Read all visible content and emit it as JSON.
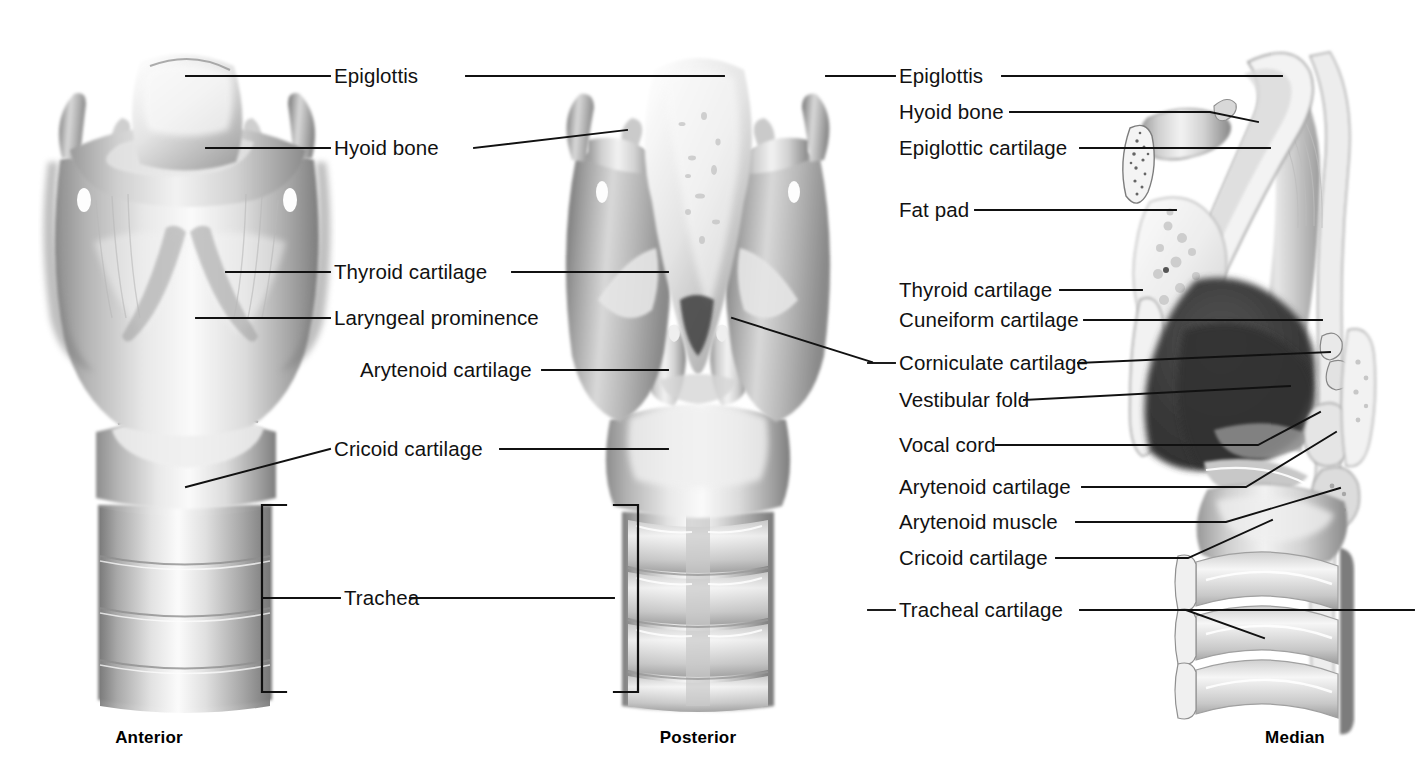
{
  "figure": {
    "kind": "anatomical-illustration",
    "background": "#ffffff",
    "line_color": "#111111",
    "views": [
      {
        "id": "anterior",
        "caption": "Anterior"
      },
      {
        "id": "posterior",
        "caption": "Posterior"
      },
      {
        "id": "median",
        "caption": "Median"
      }
    ]
  },
  "captions": {
    "anterior": "Anterior",
    "posterior": "Posterior",
    "median": "Median"
  },
  "labels_left": [
    {
      "id": "epiglottis",
      "text": "Epiglottis"
    },
    {
      "id": "hyoid-bone",
      "text": "Hyoid bone"
    },
    {
      "id": "thyroid-cartilage",
      "text": "Thyroid cartilage"
    },
    {
      "id": "laryngeal-prominence",
      "text": "Laryngeal prominence"
    },
    {
      "id": "arytenoid-cartilage",
      "text": "Arytenoid cartilage"
    },
    {
      "id": "cricoid-cartilage",
      "text": "Cricoid cartilage"
    },
    {
      "id": "trachea",
      "text": "Trachea"
    }
  ],
  "labels_right": [
    {
      "id": "epiglottis",
      "text": "Epiglottis"
    },
    {
      "id": "hyoid-bone",
      "text": "Hyoid bone"
    },
    {
      "id": "epiglottic-cartilage",
      "text": "Epiglottic cartilage"
    },
    {
      "id": "fat-pad",
      "text": "Fat pad"
    },
    {
      "id": "thyroid-cartilage",
      "text": "Thyroid cartilage"
    },
    {
      "id": "cuneiform-cartilage",
      "text": "Cuneiform cartilage"
    },
    {
      "id": "corniculate-cartilage",
      "text": "Corniculate cartilage"
    },
    {
      "id": "vestibular-fold",
      "text": "Vestibular fold"
    },
    {
      "id": "vocal-cord",
      "text": "Vocal cord"
    },
    {
      "id": "arytenoid-cartilage",
      "text": "Arytenoid cartilage"
    },
    {
      "id": "arytenoid-muscle",
      "text": "Arytenoid muscle"
    },
    {
      "id": "cricoid-cartilage",
      "text": "Cricoid cartilage"
    },
    {
      "id": "tracheal-cartilage",
      "text": "Tracheal cartilage"
    }
  ]
}
